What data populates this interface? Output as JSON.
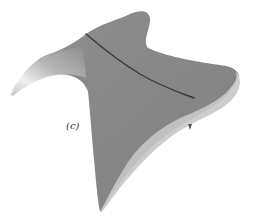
{
  "figure": {
    "panel_label": "(c)",
    "colors": {
      "background": "#ffffff",
      "surface_top": "#8a8a8a",
      "surface_dark": "#7a7a7a",
      "surface_side": "#bdbdbd",
      "highlight": "#f2f2f2",
      "ridge_line": "#3a3a3a",
      "label": "#333333"
    }
  }
}
